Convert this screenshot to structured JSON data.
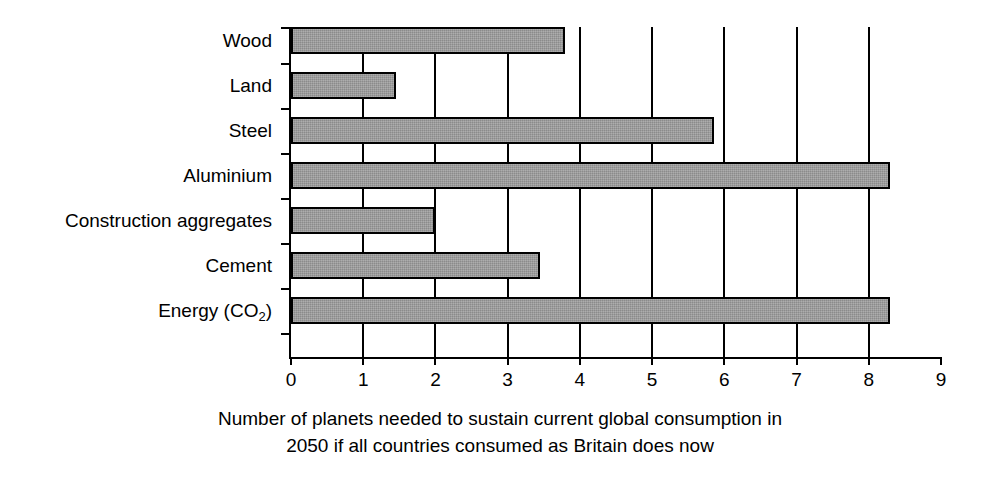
{
  "chart_data": {
    "type": "bar",
    "orientation": "horizontal",
    "title": "",
    "xlabel": "Number of planets needed to sustain current global consumption in 2050 if all countries consumed as Britain does now",
    "ylabel": "",
    "categories": [
      "Wood",
      "Land",
      "Steel",
      "Aluminium",
      "Construction aggregates",
      "Cement",
      "Energy (CO2)"
    ],
    "category_labels_html": [
      "Wood",
      "Land",
      "Steel",
      "Aluminium",
      "Construction aggregates",
      "Energy (CO<sub>2</sub>)"
    ],
    "values": [
      3.8,
      1.45,
      5.85,
      8.3,
      2.0,
      3.45,
      8.3
    ],
    "xlim": [
      0,
      9
    ],
    "xticks": [
      0,
      1,
      2,
      3,
      4,
      5,
      6,
      7,
      8,
      9
    ],
    "xtick_labels": [
      "0",
      "1",
      "2",
      "3",
      "4",
      "5",
      "6",
      "7",
      "8",
      "9"
    ],
    "grid": "vertical",
    "legend": "none",
    "bar_color": "#9a9a9a",
    "bar_edge_color": "#000000",
    "axis_color": "#000000",
    "background": "#ffffff"
  },
  "caption": {
    "line1": "Number of planets needed to sustain current global consumption in",
    "line2": "2050 if all countries consumed as Britain does now"
  },
  "labels": {
    "wood": "Wood",
    "land": "Land",
    "steel": "Steel",
    "aluminium": "Aluminium",
    "construction_aggregates": "Construction aggregates",
    "cement": "Cement",
    "energy_prefix": "Energy (CO",
    "energy_sub": "2",
    "energy_suffix": ")"
  }
}
